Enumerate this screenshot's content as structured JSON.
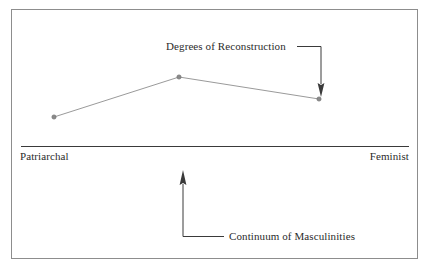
{
  "figure": {
    "kind": "conceptual-line-diagram",
    "frame": {
      "stroke": "#8d8d8d"
    },
    "background": "#ffffff"
  },
  "annotations": {
    "degrees_label": "Degrees of Reconstruction",
    "continuum_label": "Continuum of Masculinities"
  },
  "axis": {
    "left_label": "Patriarchal",
    "right_label": "Feminist",
    "stroke": "#3a3a3a"
  },
  "colors": {
    "frame": "#8d8d8d",
    "axis": "#3a3a3a",
    "series_line": "#9a9a9a",
    "marker_fill": "#8a8a8a",
    "marker_stroke": "#6f6f6f",
    "leader": "#4a4a4a",
    "text": "#2b2b2b"
  },
  "chart_data": {
    "type": "line",
    "title": "Continuum of Masculinities",
    "xlabel": "Continuum of Masculinities",
    "ylabel": "Degrees of Reconstruction",
    "grid": false,
    "legend": null,
    "axis_endpoint_labels": [
      "Patriarchal",
      "Feminist"
    ],
    "x": [
      "Patriarchal",
      "Midpoint",
      "Feminist"
    ],
    "categories": [
      "Patriarchal",
      "Midpoint",
      "Feminist"
    ],
    "series": [
      {
        "name": "Degrees of Reconstruction",
        "values": [
          0.22,
          0.52,
          0.36
        ],
        "points_px": [
          {
            "x": 54,
            "y": 117
          },
          {
            "x": 179,
            "y": 77
          },
          {
            "x": 319,
            "y": 99
          }
        ]
      }
    ],
    "xlim": [
      0,
      1
    ],
    "ylim": [
      0,
      1
    ],
    "annotations": [
      {
        "text": "Degrees of Reconstruction",
        "points_to": "third data point",
        "arrow_direction": "down"
      },
      {
        "text": "Continuum of Masculinities",
        "points_to": "horizontal axis",
        "arrow_direction": "up"
      }
    ]
  }
}
